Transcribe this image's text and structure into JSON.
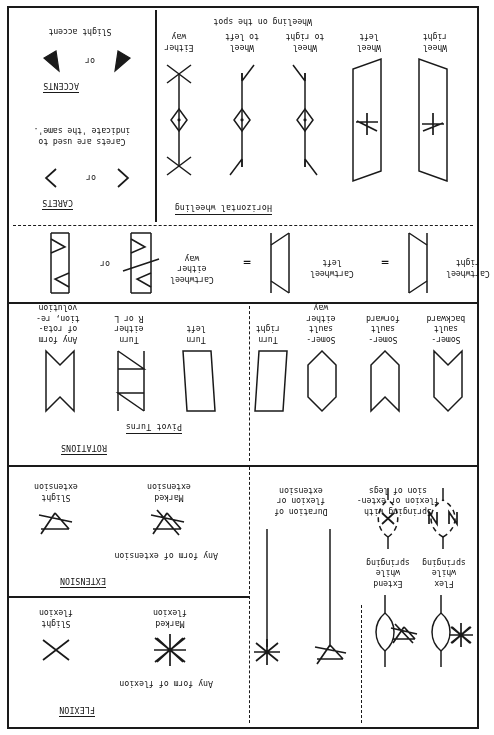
{
  "document": {
    "title": "Labanotation Symbols Reference Sheet",
    "orientation": "rotated-180"
  },
  "sections": {
    "carets": {
      "header": "CARETS",
      "or_label": "or",
      "description": "Carets are used to\nindicate 'the same'.",
      "symbols": [
        "caret-right",
        "caret-left"
      ]
    },
    "accents": {
      "header": "ACCENTS",
      "or_label": "or",
      "caption": "Slight accent",
      "symbols": [
        "accent-wedge-right",
        "accent-wedge-left"
      ]
    },
    "horizontal_wheeling": {
      "header": "Horizontal wheeling",
      "caption": "Wheeling on the spot",
      "items": [
        {
          "label": "Either\nway",
          "symbol": "wheel-either-way"
        },
        {
          "label": "Wheel\nto left",
          "symbol": "wheel-to-left"
        },
        {
          "label": "Wheel\nto right",
          "symbol": "wheel-to-right"
        },
        {
          "label": "Wheel\nleft",
          "symbol": "wheel-left-parallelogram"
        },
        {
          "label": "Wheel\nright",
          "symbol": "wheel-right-parallelogram"
        }
      ]
    },
    "cartwheel": {
      "or_label": "or",
      "equals_label": "=",
      "items": [
        {
          "label": "Cartwheel\neither\nway",
          "symbol": "cartwheel-either-way-alt"
        },
        {
          "label": "",
          "symbol": "cartwheel-either-way"
        },
        {
          "label": "Cartwheel\nleft",
          "symbol": "cartwheel-left"
        },
        {
          "label": "Cartwheel\nright",
          "symbol": "cartwheel-right"
        }
      ]
    },
    "rotations": {
      "header": "ROTATIONS",
      "subheader": "Pivot Turns",
      "items": [
        {
          "label": "Any form\nof rota-\ntion, re-\nvolution",
          "symbol": "rotation-any-form"
        },
        {
          "label": "Turn\neither\nR or L",
          "symbol": "turn-either-way"
        },
        {
          "label": "Turn\nleft",
          "symbol": "turn-left"
        },
        {
          "label": "Turn\nright",
          "symbol": "turn-right"
        }
      ],
      "somersaults": [
        {
          "label": "Somer-\nsault\neither\nway",
          "symbol": "somersault-either-way"
        },
        {
          "label": "Somer-\nsault\nforward",
          "symbol": "somersault-forward"
        },
        {
          "label": "Somer-\nsault\nbackward",
          "symbol": "somersault-backward"
        }
      ]
    },
    "flexion": {
      "header": "FLEXION",
      "caption": "Any form of flexion",
      "items": [
        {
          "label": "Slight\nflexion",
          "symbol": "slight-flexion-x"
        },
        {
          "label": "Marked\nflexion",
          "symbol": "marked-flexion-asterisk"
        }
      ]
    },
    "extension": {
      "header": "EXTENSION",
      "caption": "Any form of extension",
      "items": [
        {
          "label": "Slight\nextension",
          "symbol": "slight-extension"
        },
        {
          "label": "Marked\nextension",
          "symbol": "marked-extension"
        }
      ]
    },
    "duration": {
      "caption": "Duration of\nflexion or\nextension",
      "items": [
        {
          "symbol": "duration-flexion-bar"
        },
        {
          "symbol": "duration-extension-bar"
        }
      ]
    },
    "springing": {
      "caption": "Springing with\nflexion or exten-\nsion of legs",
      "items": [
        {
          "label": "Extend\nwhile\nspringing",
          "symbol": "spring-extend-dashed-ring"
        },
        {
          "label": "Flex\nwhile\nspringing",
          "symbol": "spring-flex-dashed-ring"
        },
        {
          "label": "",
          "symbol": "spring-extend-solid-ring"
        },
        {
          "label": "",
          "symbol": "spring-flex-solid-ring"
        }
      ]
    }
  }
}
